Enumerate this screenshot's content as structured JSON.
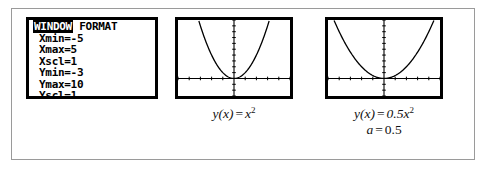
{
  "figure": {
    "name": "graphing-calculator-window-format-and-parabolas",
    "border_color": "#9a9a9a",
    "ink_color": "#000000"
  },
  "calculator": {
    "screen_name": "lcd-screen",
    "header": {
      "highlighted_label": "WINDOW",
      "plain_label": "FORMAT"
    },
    "settings": [
      {
        "key": "Xmin",
        "value": "-5",
        "line": "Xmin=-5"
      },
      {
        "key": "Xmax",
        "value": "5",
        "line": "Xmax=5"
      },
      {
        "key": "Xscl",
        "value": "1",
        "line": "Xscl=1"
      },
      {
        "key": "Ymin",
        "value": "-3",
        "line": "Ymin=-3"
      },
      {
        "key": "Ymax",
        "value": "10",
        "line": "Ymax=10"
      },
      {
        "key": "Yscl",
        "value": "1",
        "line": "Yscl=1"
      }
    ]
  },
  "graphs": [
    {
      "id": "graph-1",
      "coefficient": 1,
      "xmin": -5,
      "xmax": 5,
      "ymin": -3,
      "ymax": 10,
      "xscl": 1,
      "yscl": 1,
      "caption_lines": [
        {
          "lhs": "y",
          "arg": "(x)",
          "eq": "=",
          "rhs": "x",
          "exp": "2"
        }
      ]
    },
    {
      "id": "graph-2",
      "coefficient": 0.5,
      "xmin": -5,
      "xmax": 5,
      "ymin": -3,
      "ymax": 10,
      "xscl": 1,
      "yscl": 1,
      "caption_lines": [
        {
          "lhs": "y",
          "arg": "(x)",
          "eq": "=",
          "rhs": "0.5x",
          "exp": "2"
        },
        {
          "lhs": "a",
          "arg": "",
          "eq": "=",
          "rhs": "0.5",
          "exp": ""
        }
      ]
    }
  ],
  "chart_data": [
    {
      "type": "line",
      "title": "y(x) = x^2",
      "xlabel": "x",
      "ylabel": "y",
      "xlim": [
        -5,
        5
      ],
      "ylim": [
        -3,
        10
      ],
      "xscl": 1,
      "yscl": 1,
      "grid": false,
      "series": [
        {
          "name": "y = x^2",
          "x": [
            -3.2,
            -3.0,
            -2.5,
            -2.0,
            -1.5,
            -1.0,
            -0.5,
            0,
            0.5,
            1.0,
            1.5,
            2.0,
            2.5,
            3.0,
            3.2
          ],
          "y": [
            10.24,
            9.0,
            6.25,
            4.0,
            2.25,
            1.0,
            0.25,
            0,
            0.25,
            1.0,
            2.25,
            4.0,
            6.25,
            9.0,
            10.24
          ]
        }
      ]
    },
    {
      "type": "line",
      "title": "y(x) = 0.5x^2",
      "xlabel": "x",
      "ylabel": "y",
      "xlim": [
        -5,
        5
      ],
      "ylim": [
        -3,
        10
      ],
      "xscl": 1,
      "yscl": 1,
      "grid": false,
      "annotations": [
        "a = 0.5"
      ],
      "series": [
        {
          "name": "y = 0.5x^2",
          "x": [
            -4.47,
            -4.0,
            -3.5,
            -3.0,
            -2.5,
            -2.0,
            -1.5,
            -1.0,
            -0.5,
            0,
            0.5,
            1.0,
            1.5,
            2.0,
            2.5,
            3.0,
            3.5,
            4.0,
            4.47
          ],
          "y": [
            10.0,
            8.0,
            6.125,
            4.5,
            3.125,
            2.0,
            1.125,
            0.5,
            0.125,
            0,
            0.125,
            0.5,
            1.125,
            2.0,
            3.125,
            4.5,
            6.125,
            8.0,
            10.0
          ]
        }
      ]
    }
  ]
}
